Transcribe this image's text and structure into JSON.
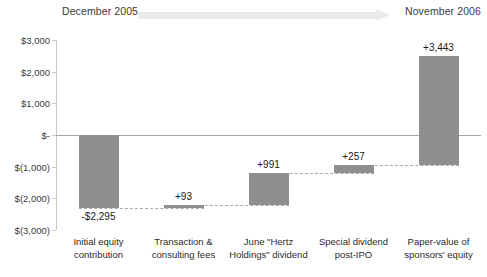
{
  "timeline": {
    "start_label": "December 2005",
    "end_label": "November 2006",
    "arrow_icon": "right-arrow-icon",
    "arrow_color": "#ebebeb"
  },
  "chart_data": {
    "type": "bar",
    "subtype": "waterfall",
    "title": "",
    "xlabel": "",
    "ylabel": "",
    "ylim": [
      -3000,
      3000
    ],
    "ytick_values": [
      3000,
      2000,
      1000,
      0,
      -1000,
      -2000,
      -3000
    ],
    "ytick_labels": [
      "$3,000",
      "$2,000",
      "$1,000",
      "$-",
      "$(1,000)",
      "$(2,000)",
      "$(3,000)"
    ],
    "grid": false,
    "legend": "none",
    "bar_color": "#8f8f8f",
    "connector_style": "dashed",
    "categories": [
      "Initial equity contribution",
      "Transaction & consulting fees",
      "June \"Hertz Holdings\" dividend",
      "Special dividend post-IPO",
      "Paper-value of sponsors' equity"
    ],
    "category_lines": [
      [
        "Initial equity",
        "contribution"
      ],
      [
        "Transaction &",
        "consulting fees"
      ],
      [
        "June \"Hertz",
        "Holdings\" dividend"
      ],
      [
        "Special dividend",
        "post-IPO"
      ],
      [
        "Paper-value of",
        "sponsors' equity"
      ]
    ],
    "values": [
      -2295,
      93,
      991,
      257,
      3443
    ],
    "value_labels": [
      "-$2,295",
      "+93",
      "+991",
      "+257",
      "+3,443"
    ],
    "bar_bases": [
      0,
      -2295,
      -2202,
      -1211,
      -954
    ],
    "bar_tops": [
      -2295,
      -2202,
      -1211,
      -954,
      2489
    ],
    "is_total": [
      false,
      false,
      false,
      false,
      true
    ]
  }
}
